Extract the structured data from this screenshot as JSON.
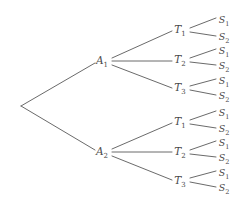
{
  "diagram": {
    "type": "tree",
    "title": "",
    "background_color": "#ffffff",
    "edge_color": "#595959",
    "edge_width": 0.9,
    "label_color": "#4a4a4a",
    "root": {
      "x": 21,
      "y": 106,
      "label": ""
    },
    "levels": [
      {
        "name": "action",
        "symbol": "A",
        "count": 2
      },
      {
        "name": "type",
        "symbol": "T",
        "count": 3
      },
      {
        "name": "signal",
        "symbol": "S",
        "count": 2
      }
    ],
    "nodes": [
      {
        "id": "root",
        "label": "",
        "base": "",
        "sub": "",
        "x": 21,
        "y": 106,
        "level": 0
      },
      {
        "id": "A1",
        "label": "A1",
        "base": "A",
        "sub": "1",
        "x": 102,
        "y": 61,
        "level": 1
      },
      {
        "id": "A2",
        "label": "A2",
        "base": "A",
        "sub": "2",
        "x": 102,
        "y": 152,
        "level": 1
      },
      {
        "id": "A1T1",
        "label": "T1",
        "base": "T",
        "sub": "1",
        "x": 180,
        "y": 30,
        "level": 2
      },
      {
        "id": "A1T2",
        "label": "T2",
        "base": "T",
        "sub": "2",
        "x": 180,
        "y": 60,
        "level": 2
      },
      {
        "id": "A1T3",
        "label": "T3",
        "base": "T",
        "sub": "3",
        "x": 180,
        "y": 88,
        "level": 2
      },
      {
        "id": "A2T1",
        "label": "T1",
        "base": "T",
        "sub": "1",
        "x": 180,
        "y": 122,
        "level": 2
      },
      {
        "id": "A2T2",
        "label": "T2",
        "base": "T",
        "sub": "2",
        "x": 180,
        "y": 152,
        "level": 2
      },
      {
        "id": "A2T3",
        "label": "T3",
        "base": "T",
        "sub": "3",
        "x": 180,
        "y": 181,
        "level": 2
      },
      {
        "id": "A1T1S1",
        "label": "S1",
        "base": "S",
        "sub": "1",
        "x": 224,
        "y": 20,
        "level": 3
      },
      {
        "id": "A1T1S2",
        "label": "S2",
        "base": "S",
        "sub": "2",
        "x": 224,
        "y": 37,
        "level": 3
      },
      {
        "id": "A1T2S1",
        "label": "S1",
        "base": "S",
        "sub": "1",
        "x": 224,
        "y": 51,
        "level": 3
      },
      {
        "id": "A1T2S2",
        "label": "S2",
        "base": "S",
        "sub": "2",
        "x": 224,
        "y": 66,
        "level": 3
      },
      {
        "id": "A1T3S1",
        "label": "S1",
        "base": "S",
        "sub": "1",
        "x": 224,
        "y": 81,
        "level": 3
      },
      {
        "id": "A1T3S2",
        "label": "S2",
        "base": "S",
        "sub": "2",
        "x": 224,
        "y": 96,
        "level": 3
      },
      {
        "id": "A2T1S1",
        "label": "S1",
        "base": "S",
        "sub": "1",
        "x": 224,
        "y": 113,
        "level": 3
      },
      {
        "id": "A2T1S2",
        "label": "S2",
        "base": "S",
        "sub": "2",
        "x": 224,
        "y": 129,
        "level": 3
      },
      {
        "id": "A2T2S1",
        "label": "S1",
        "base": "S",
        "sub": "1",
        "x": 224,
        "y": 143,
        "level": 3
      },
      {
        "id": "A2T2S2",
        "label": "S2",
        "base": "S",
        "sub": "2",
        "x": 224,
        "y": 158,
        "level": 3
      },
      {
        "id": "A2T3S1",
        "label": "S1",
        "base": "S",
        "sub": "1",
        "x": 224,
        "y": 173,
        "level": 3
      },
      {
        "id": "A2T3S2",
        "label": "S2",
        "base": "S",
        "sub": "2",
        "x": 224,
        "y": 188,
        "level": 3
      }
    ],
    "edges": [
      {
        "from": "root",
        "to": "A1",
        "x1": 21,
        "y1": 106,
        "x2": 95,
        "y2": 63
      },
      {
        "from": "root",
        "to": "A2",
        "x1": 21,
        "y1": 106,
        "x2": 95,
        "y2": 150
      },
      {
        "from": "A1",
        "to": "A1T1",
        "x1": 112,
        "y1": 58,
        "x2": 172,
        "y2": 31
      },
      {
        "from": "A1",
        "to": "A1T2",
        "x1": 112,
        "y1": 61,
        "x2": 172,
        "y2": 61
      },
      {
        "from": "A1",
        "to": "A1T3",
        "x1": 112,
        "y1": 65,
        "x2": 172,
        "y2": 88
      },
      {
        "from": "A2",
        "to": "A2T1",
        "x1": 112,
        "y1": 149,
        "x2": 172,
        "y2": 123
      },
      {
        "from": "A2",
        "to": "A2T2",
        "x1": 112,
        "y1": 152,
        "x2": 172,
        "y2": 152
      },
      {
        "from": "A2",
        "to": "A2T3",
        "x1": 112,
        "y1": 156,
        "x2": 172,
        "y2": 180
      },
      {
        "from": "A1T1",
        "to": "A1T1S1",
        "x1": 190,
        "y1": 28,
        "x2": 216,
        "y2": 18
      },
      {
        "from": "A1T1",
        "to": "A1T1S2",
        "x1": 190,
        "y1": 32,
        "x2": 216,
        "y2": 36
      },
      {
        "from": "A1T2",
        "to": "A1T2S1",
        "x1": 190,
        "y1": 58,
        "x2": 216,
        "y2": 49
      },
      {
        "from": "A1T2",
        "to": "A1T2S2",
        "x1": 190,
        "y1": 62,
        "x2": 216,
        "y2": 65
      },
      {
        "from": "A1T3",
        "to": "A1T3S1",
        "x1": 190,
        "y1": 86,
        "x2": 216,
        "y2": 79
      },
      {
        "from": "A1T3",
        "to": "A1T3S2",
        "x1": 190,
        "y1": 90,
        "x2": 216,
        "y2": 95
      },
      {
        "from": "A2T1",
        "to": "A2T1S1",
        "x1": 190,
        "y1": 120,
        "x2": 216,
        "y2": 111
      },
      {
        "from": "A2T1",
        "to": "A2T1S2",
        "x1": 190,
        "y1": 124,
        "x2": 216,
        "y2": 128
      },
      {
        "from": "A2T2",
        "to": "A2T2S1",
        "x1": 190,
        "y1": 150,
        "x2": 216,
        "y2": 141
      },
      {
        "from": "A2T2",
        "to": "A2T2S2",
        "x1": 190,
        "y1": 154,
        "x2": 216,
        "y2": 157
      },
      {
        "from": "A2T3",
        "to": "A2T3S1",
        "x1": 190,
        "y1": 178,
        "x2": 216,
        "y2": 171
      },
      {
        "from": "A2T3",
        "to": "A2T3S2",
        "x1": 190,
        "y1": 182,
        "x2": 216,
        "y2": 187
      }
    ]
  }
}
